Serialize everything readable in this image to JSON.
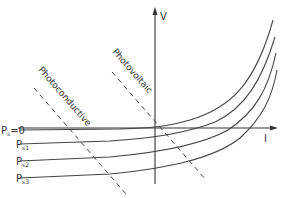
{
  "diagram": {
    "title": "",
    "axes": {
      "vertical_label": "V",
      "horizontal_label": "I"
    },
    "curves": [
      {
        "label_main": "P",
        "label_sub": "s",
        "label_tail": "=0"
      },
      {
        "label_main": "P",
        "label_sub": "s1",
        "label_tail": ""
      },
      {
        "label_main": "P",
        "label_sub": "s2",
        "label_tail": ""
      },
      {
        "label_main": "P",
        "label_sub": "s3",
        "label_tail": ""
      }
    ],
    "regions": [
      {
        "label": "Photoconductive"
      },
      {
        "label": "Photovoltaic"
      }
    ],
    "colors": {
      "line": "#444444",
      "background": "#ffffff"
    }
  }
}
